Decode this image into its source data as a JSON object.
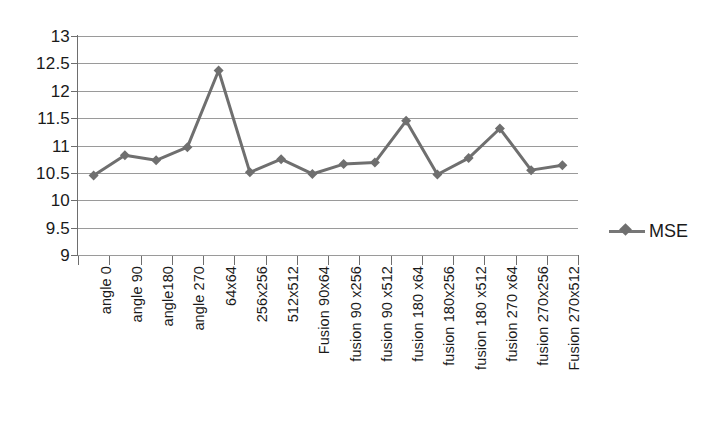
{
  "chart_data": {
    "type": "line",
    "title": "",
    "xlabel": "",
    "ylabel": "",
    "ylim": [
      9,
      13
    ],
    "ytick_step": 0.5,
    "yticks": [
      "13",
      "12.5",
      "12",
      "11.5",
      "11",
      "10.5",
      "10",
      "9.5",
      "9"
    ],
    "grid": true,
    "legend_position": "right",
    "categories": [
      "angle 0",
      "angle 90",
      "angle180",
      "angle 270",
      "64x64",
      "256x256",
      "512x512",
      "Fusion 90x64",
      "fusion 90 x256",
      "fusion 90 x512",
      "fusion 180 x64",
      "fusion 180x256",
      "fusion 180 x512",
      "fusion 270 x64",
      "fusion 270x256",
      "Fusion 270x512"
    ],
    "series": [
      {
        "name": "MSE",
        "color": "#6f6f6f",
        "marker": "diamond",
        "values": [
          10.45,
          10.82,
          10.73,
          10.97,
          12.37,
          10.51,
          10.75,
          10.48,
          10.66,
          10.69,
          11.45,
          10.47,
          10.77,
          11.31,
          10.55,
          10.64
        ]
      }
    ]
  },
  "legend": {
    "entries": [
      {
        "label": "MSE"
      }
    ]
  }
}
